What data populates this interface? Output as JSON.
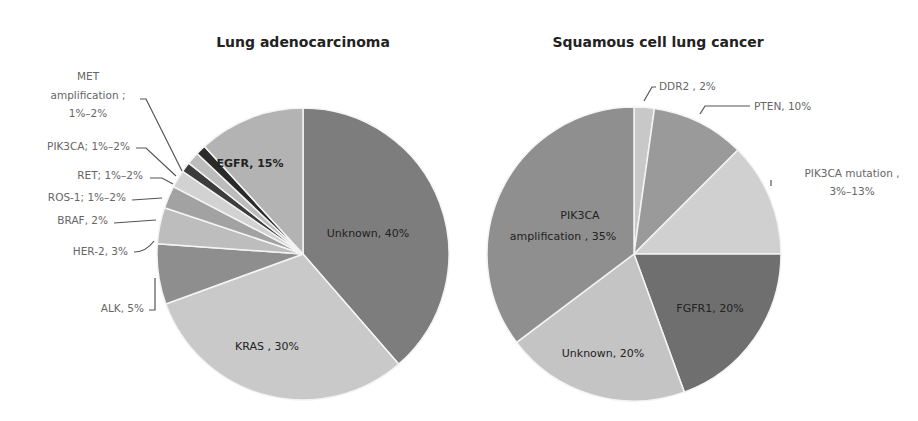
{
  "chart_data": [
    {
      "type": "pie",
      "title": "Lung adenocarcinoma",
      "start_angle_deg": 0,
      "direction": "clockwise",
      "slices": [
        {
          "label": "Unknown",
          "value_text": "40%",
          "value": 40,
          "color": "#7d7d7d",
          "display": "Unknown, 40%"
        },
        {
          "label": "KRAS",
          "value_text": "30%",
          "value": 30,
          "color": "#c9c9c9",
          "display": "KRAS , 30%"
        },
        {
          "label": "ALK",
          "value_text": "5%",
          "value": 5,
          "color": "#8e8e8e",
          "display": "ALK, 5%"
        },
        {
          "label": "HER-2",
          "value_text": "3%",
          "value": 3,
          "color": "#bdbdbd",
          "display": "HER-2, 3%"
        },
        {
          "label": "BRAF",
          "value_text": "2%",
          "value": 2,
          "color": "#a2a2a2",
          "display": "BRAF, 2%"
        },
        {
          "label": "ROS-1",
          "value_text": "1%–2%",
          "value": 1.5,
          "color": "#d2d2d2",
          "display": "ROS-1; 1%–2%"
        },
        {
          "label": "RET",
          "value_text": "1%–2%",
          "value": 1,
          "color": "#3c3c3c",
          "display": "RET; 1%–2%"
        },
        {
          "label": "PIK3CA",
          "value_text": "1%–2%",
          "value": 1,
          "color": "#bcbcbc",
          "display": "PIK3CA; 1%–2%"
        },
        {
          "label": "MET amplification",
          "value_text": "1%–2%",
          "value": 1,
          "color": "#2a2a2a",
          "display": "MET amplification ; 1%–2%"
        },
        {
          "label": "EGFR",
          "value_text": "15%",
          "value": 15,
          "color": "#b3b3b3",
          "display": "EGFR, 15%"
        }
      ]
    },
    {
      "type": "pie",
      "title": "Squamous cell lung cancer",
      "start_angle_deg": 0,
      "direction": "clockwise",
      "slices": [
        {
          "label": "DDR2",
          "value_text": "2%",
          "value": 2,
          "color": "#c8c8c8",
          "display": "DDR2 , 2%"
        },
        {
          "label": "PTEN",
          "value_text": "10%",
          "value": 10,
          "color": "#9a9a9a",
          "display": "PTEN, 10%"
        },
        {
          "label": "PIK3CA mutation",
          "value_text": "3%–13%",
          "value": 13,
          "color": "#d0d0d0",
          "display": "PIK3CA mutation , 3%–13%"
        },
        {
          "label": "FGFR1",
          "value_text": "20%",
          "value": 20,
          "color": "#6f6f6f",
          "display": "FGFR1, 20%"
        },
        {
          "label": "Unknown",
          "value_text": "20%",
          "value": 20,
          "color": "#c4c4c4",
          "display": "Unknown, 20%"
        },
        {
          "label": "PIK3CA amplification",
          "value_text": "35%",
          "value": 35,
          "color": "#8f8f8f",
          "display": "PIK3CA amplification , 35%"
        }
      ]
    }
  ],
  "left": {
    "title": "Lung adenocarcinoma",
    "labels": {
      "unknown": "Unknown, 40%",
      "kras": "KRAS , 30%",
      "egfr": "EGFR, 15%",
      "alk": "ALK, 5%",
      "her2": "HER-2, 3%",
      "braf": "BRAF, 2%",
      "ros1": "ROS-1; 1%–2%",
      "ret": "RET; 1%–2%",
      "pik3ca": "PIK3CA; 1%–2%",
      "met_line1": "MET",
      "met_line2": "amplification ;",
      "met_line3": "1%–2%"
    }
  },
  "right": {
    "title": "Squamous cell lung cancer",
    "labels": {
      "ddr2": "DDR2 , 2%",
      "pten": "PTEN, 10%",
      "pik3ca_mut_line1": "PIK3CA mutation ,",
      "pik3ca_mut_line2": "3%–13%",
      "fgfr1": "FGFR1, 20%",
      "unknown": "Unknown, 20%",
      "pik3ca_amp_line1": "PIK3CA",
      "pik3ca_amp_line2": "amplification , 35%"
    }
  }
}
